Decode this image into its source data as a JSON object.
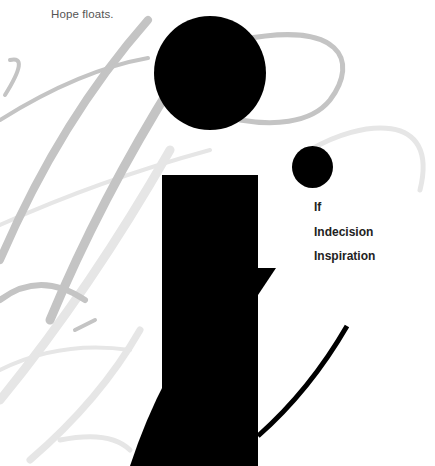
{
  "header": {
    "tagline": "Hope floats."
  },
  "nav": {
    "items": [
      {
        "label": "If"
      },
      {
        "label": "Indecision"
      },
      {
        "label": "Inspiration"
      }
    ]
  },
  "logo": {
    "glyph": "i",
    "description": "Large black abstract letter 'i' with a dot and secondary small dot",
    "colors": {
      "foreground": "#000000",
      "script_dark": "#c4c4c4",
      "script_light": "#e6e6e6",
      "background": "#ffffff"
    }
  }
}
